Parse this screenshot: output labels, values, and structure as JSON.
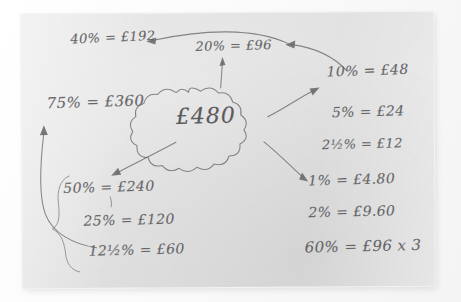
{
  "photo": {
    "subject": "handwritten-percentage-mind-map",
    "surface_color": "#f5f5f6",
    "paper_color": "#e3e3e3",
    "pencil_color": "#6e6e70"
  },
  "center": {
    "label": "£480",
    "shape": "cloud-bubble"
  },
  "notes": {
    "pct40": "40% = £192",
    "pct20": "20% = £96",
    "pct10": "10% = £48",
    "pct75": "75% = £360",
    "pct5": "5% = £24",
    "pct2half": "2½% = £12",
    "pct50": "50% = £240",
    "pct1": "1% = £4.80",
    "pct25": "25% = £120",
    "pct2": "2% = £9.60",
    "pct12half": "12½% = £60",
    "pct60": "60% = £96 x 3"
  }
}
